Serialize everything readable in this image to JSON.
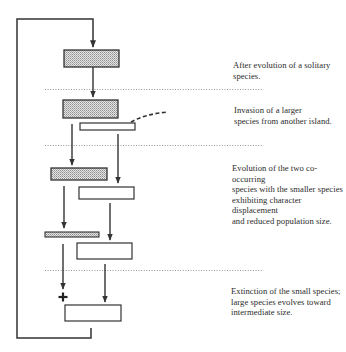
{
  "diagram": {
    "type": "flow-diagram",
    "stages": [
      {
        "id": "stage-1",
        "caption": "After evolution of a solitary species.",
        "boxes": [
          {
            "species": "small",
            "fill": "stippled"
          }
        ]
      },
      {
        "id": "stage-2",
        "caption": "Invasion of a larger\nspecies from another island.",
        "boxes": [
          {
            "species": "small",
            "fill": "stippled"
          },
          {
            "species": "large",
            "fill": "white",
            "note": "invader, dashed arrival path"
          }
        ]
      },
      {
        "id": "stage-3",
        "caption": "Evolution of the two co-occurring\nspecies with the smaller species\nexhibiting character displacement\nand reduced population size.",
        "boxes": [
          {
            "species": "small",
            "fill": "stippled"
          },
          {
            "species": "large",
            "fill": "white"
          },
          {
            "species": "small",
            "fill": "stippled",
            "note": "thin, reduced population"
          },
          {
            "species": "large",
            "fill": "white"
          }
        ]
      },
      {
        "id": "stage-4",
        "caption": "Extinction of the small species;\nlarge species evolves toward\nintermediate size.",
        "boxes": [
          {
            "species": "large",
            "fill": "white",
            "note": "intermediate size"
          }
        ],
        "extinction_marker": "+"
      }
    ],
    "loop": "feedback line returns from final stage to the top of the cycle",
    "colors": {
      "line": "#333333",
      "stipple": "#bdbdbd",
      "box_fill_white": "#ffffff",
      "dotted_divider": "#888888"
    }
  }
}
